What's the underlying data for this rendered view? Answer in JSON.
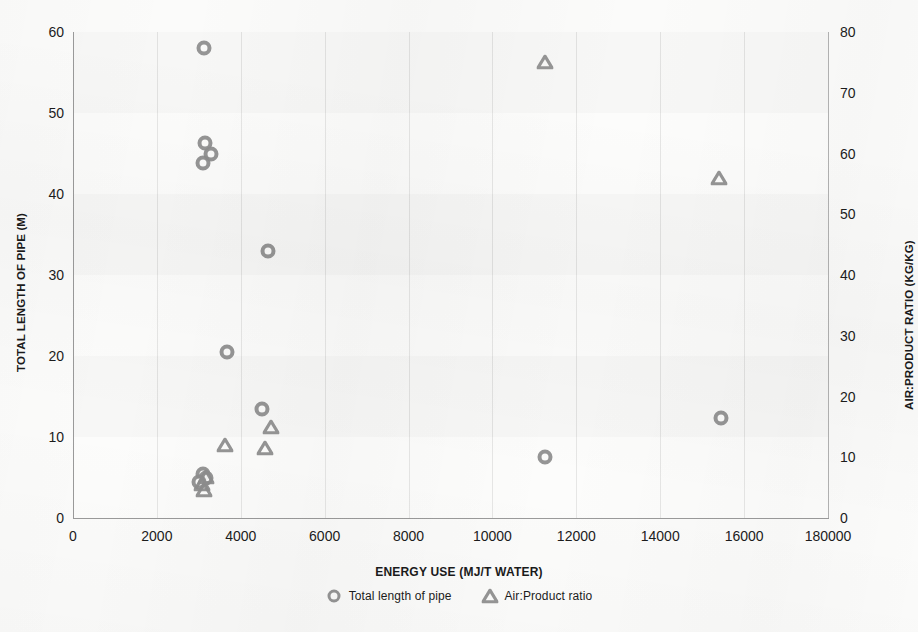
{
  "chart_data": {
    "type": "scatter",
    "title": "",
    "xlabel": "ENERGY USE (MJ/T WATER)",
    "ylabel": "TOTAL LENGTH OF PIPE (M)",
    "y2label": "AIR:PRODUCT RATIO (KG/KG)",
    "xlim": [
      0,
      18000
    ],
    "ylim": [
      0,
      60
    ],
    "y2lim": [
      0,
      80
    ],
    "grid": "vertical gridlines at every x tick; faint horizontal shaded bands",
    "legend_position": "bottom-center",
    "xticks": [
      0,
      2000,
      4000,
      6000,
      8000,
      10000,
      12000,
      14000,
      16000,
      18000
    ],
    "xticklabels": [
      "0",
      "2000",
      "4000",
      "6000",
      "8000",
      "10000",
      "12000",
      "14000",
      "16000",
      "180000"
    ],
    "yticks": [
      0,
      10,
      20,
      30,
      40,
      50,
      60
    ],
    "yticklabels": [
      "0",
      "10",
      "20",
      "30",
      "40",
      "50",
      "60"
    ],
    "y2ticks": [
      0,
      10,
      20,
      30,
      40,
      50,
      60,
      70,
      80
    ],
    "y2ticklabels": [
      "0",
      "10",
      "20",
      "30",
      "40",
      "50",
      "60",
      "70",
      "80"
    ],
    "series": [
      {
        "name": "Total length of pipe",
        "marker": "circle",
        "axis": "left",
        "color": "#8d8d8d",
        "points": [
          {
            "x": 3120,
            "y": 58.0
          },
          {
            "x": 3140,
            "y": 46.3
          },
          {
            "x": 3280,
            "y": 45.0
          },
          {
            "x": 3090,
            "y": 43.8
          },
          {
            "x": 4660,
            "y": 33.0
          },
          {
            "x": 3670,
            "y": 20.5
          },
          {
            "x": 4500,
            "y": 13.4
          },
          {
            "x": 3090,
            "y": 5.4
          },
          {
            "x": 3180,
            "y": 5.0
          },
          {
            "x": 3010,
            "y": 4.4
          },
          {
            "x": 11250,
            "y": 7.5
          },
          {
            "x": 15450,
            "y": 12.3
          }
        ]
      },
      {
        "name": "Air:Product ratio",
        "marker": "triangle",
        "axis": "right",
        "color": "#8d8d8d",
        "points": [
          {
            "x": 11250,
            "y": 75.0
          },
          {
            "x": 15400,
            "y": 56.0
          },
          {
            "x": 4720,
            "y": 15.0
          },
          {
            "x": 4580,
            "y": 11.5
          },
          {
            "x": 3630,
            "y": 12.0
          },
          {
            "x": 3170,
            "y": 6.8
          },
          {
            "x": 3080,
            "y": 5.6
          },
          {
            "x": 3120,
            "y": 4.6
          }
        ]
      }
    ]
  },
  "legend": {
    "items": [
      {
        "label": "Total length of pipe",
        "marker": "circle"
      },
      {
        "label": "Air:Product ratio",
        "marker": "triangle"
      }
    ]
  }
}
